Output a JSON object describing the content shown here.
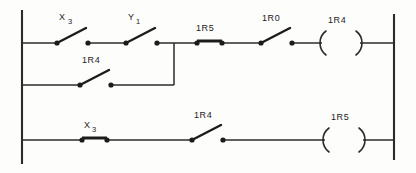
{
  "diagram": {
    "type": "ladder-logic",
    "rungs": [
      {
        "id": "rung-1",
        "elements": [
          {
            "name": "X3",
            "base": "X",
            "subscript": "3",
            "kind": "contact",
            "state": "open"
          },
          {
            "name": "Y1",
            "base": "Y",
            "subscript": "1",
            "kind": "contact",
            "state": "open"
          },
          {
            "name": "1R5",
            "base": "1R5",
            "subscript": "",
            "kind": "contact",
            "state": "closed"
          },
          {
            "name": "1R0",
            "base": "1R0",
            "subscript": "",
            "kind": "contact",
            "state": "open"
          },
          {
            "name": "1R4",
            "base": "1R4",
            "subscript": "",
            "kind": "coil",
            "state": "coil"
          }
        ]
      },
      {
        "id": "branch-1",
        "elements": [
          {
            "name": "1R4",
            "base": "1R4",
            "subscript": "",
            "kind": "contact",
            "state": "open"
          }
        ]
      },
      {
        "id": "rung-2",
        "elements": [
          {
            "name": "X3",
            "base": "X",
            "subscript": "3",
            "kind": "contact",
            "state": "closed"
          },
          {
            "name": "1R4",
            "base": "1R4",
            "subscript": "",
            "kind": "contact",
            "state": "open"
          },
          {
            "name": "1R5",
            "base": "1R5",
            "subscript": "",
            "kind": "coil",
            "state": "coil"
          }
        ]
      }
    ],
    "labels": {
      "r1_c1": "X",
      "r1_c1_sub": "3",
      "r1_c2": "Y",
      "r1_c2_sub": "1",
      "r1_c3": "1R5",
      "r1_c4": "1R0",
      "r1_coil": "1R4",
      "br_c1": "1R4",
      "r2_c1": "X",
      "r2_c1_sub": "3",
      "r2_c2": "1R4",
      "r2_coil": "1R5"
    },
    "colors": {
      "ink": "#1c1c1c",
      "wire": "#2b2b2b",
      "background": "#fdfdfc"
    }
  }
}
